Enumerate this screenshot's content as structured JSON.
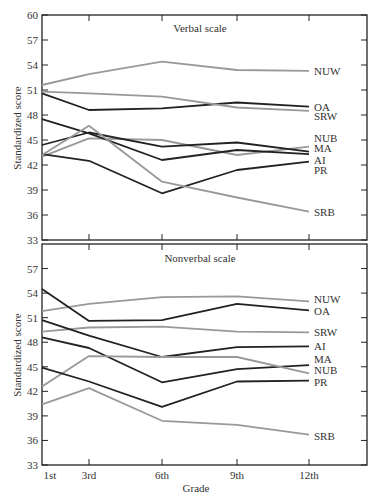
{
  "chart_data": [
    {
      "type": "line",
      "title": "Verbal scale",
      "xlabel": "Grade",
      "ylabel": "Standardized score",
      "categories": [
        "1st",
        "3rd",
        "6th",
        "9th",
        "12th"
      ],
      "yticks": [
        33,
        36,
        39,
        42,
        45,
        48,
        51,
        54,
        57,
        60
      ],
      "ylim": [
        33,
        60
      ],
      "grid": false,
      "legend_position": "inline-right",
      "series": [
        {
          "name": "NUW",
          "color": "#999999",
          "values": [
            51.6,
            52.9,
            54.4,
            53.4,
            53.3
          ]
        },
        {
          "name": "OA",
          "color": "#222222",
          "values": [
            50.6,
            48.6,
            48.8,
            49.5,
            49.0
          ]
        },
        {
          "name": "SRW",
          "color": "#999999",
          "values": [
            50.8,
            50.6,
            50.2,
            48.9,
            48.5
          ]
        },
        {
          "name": "NUB",
          "color": "#999999",
          "values": [
            43.0,
            45.2,
            45.0,
            43.2,
            44.2
          ]
        },
        {
          "name": "MA",
          "color": "#222222",
          "values": [
            44.4,
            45.9,
            44.2,
            44.7,
            43.6
          ]
        },
        {
          "name": "AI",
          "color": "#222222",
          "values": [
            47.5,
            45.8,
            42.6,
            43.8,
            43.3
          ]
        },
        {
          "name": "PR",
          "color": "#222222",
          "values": [
            43.3,
            42.5,
            38.6,
            41.4,
            42.4
          ]
        },
        {
          "name": "SRB",
          "color": "#999999",
          "values": [
            43.2,
            46.7,
            40.0,
            38.1,
            36.4
          ]
        }
      ]
    },
    {
      "type": "line",
      "title": "Nonverbal scale",
      "xlabel": "Grade",
      "ylabel": "Standardized score",
      "categories": [
        "1st",
        "3rd",
        "6th",
        "9th",
        "12th"
      ],
      "yticks": [
        33,
        36,
        39,
        42,
        45,
        48,
        51,
        54,
        57
      ],
      "ylim": [
        33,
        60
      ],
      "grid": false,
      "legend_position": "inline-right",
      "series": [
        {
          "name": "NUW",
          "color": "#999999",
          "values": [
            51.8,
            52.7,
            53.5,
            53.6,
            53.0
          ]
        },
        {
          "name": "OA",
          "color": "#222222",
          "values": [
            54.5,
            50.6,
            50.7,
            52.7,
            51.9
          ]
        },
        {
          "name": "SRW",
          "color": "#999999",
          "values": [
            49.3,
            49.8,
            49.9,
            49.3,
            49.2
          ]
        },
        {
          "name": "AI",
          "color": "#222222",
          "values": [
            50.7,
            48.8,
            46.2,
            47.4,
            47.5
          ]
        },
        {
          "name": "MA",
          "color": "#222222",
          "values": [
            48.6,
            47.3,
            43.1,
            44.7,
            45.2
          ]
        },
        {
          "name": "NUB",
          "color": "#999999",
          "values": [
            42.6,
            46.3,
            46.2,
            46.2,
            44.2
          ]
        },
        {
          "name": "PR",
          "color": "#222222",
          "values": [
            44.9,
            43.2,
            40.1,
            43.2,
            43.3
          ]
        },
        {
          "name": "SRB",
          "color": "#999999",
          "values": [
            40.4,
            42.4,
            38.4,
            37.9,
            36.7
          ]
        }
      ]
    }
  ],
  "labels": {
    "verbal_title": "Verbal scale",
    "nonverbal_title": "Nonverbal scale",
    "xlabel": "Grade",
    "ylabel": "Standardized score"
  },
  "verbal_label_positions": {
    "NUW": 53.3,
    "OA": 49.0,
    "SRW": 47.9,
    "NUB": 45.2,
    "MA": 44.0,
    "AI": 42.6,
    "PR": 41.4,
    "SRB": 36.4
  },
  "nonverbal_label_positions": {
    "NUW": 53.3,
    "OA": 51.8,
    "SRW": 49.2,
    "AI": 47.5,
    "MA": 45.9,
    "NUB": 44.6,
    "PR": 43.1,
    "SRB": 36.6
  }
}
